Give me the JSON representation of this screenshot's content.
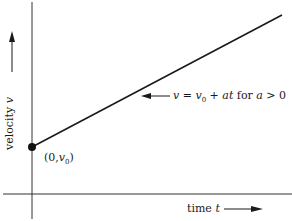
{
  "diagram": {
    "type": "velocity-time graph",
    "axes": {
      "x_label": "time",
      "x_var": "t",
      "y_label": "velocity",
      "y_var": "v"
    },
    "line": {
      "equation_lhs": "v",
      "equation_mid": " = ",
      "equation_v": "v",
      "equation_sub": "0",
      "equation_rest": " + ",
      "equation_at": "at",
      "equation_for": " for ",
      "equation_cond_var": "a",
      "equation_cond": " > 0"
    },
    "point": {
      "label_open": "(0,",
      "label_v": "v",
      "label_sub": "0",
      "label_close": ")"
    },
    "colors": {
      "line": "#1a1a1a",
      "axis": "#333333",
      "background": "#ffffff"
    }
  }
}
